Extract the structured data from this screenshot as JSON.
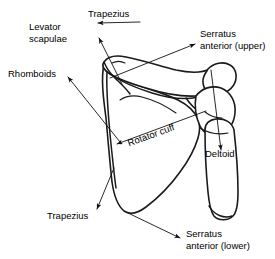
{
  "figure": {
    "view": "posterior",
    "background_color": "#ffffff",
    "line_color": "#1a1a1a"
  },
  "labels": {
    "trapezius_upper": "Trapezius",
    "levator_scapulae": "Levator\nscapulae",
    "levator_scapulae_line1": "Levator",
    "levator_scapulae_line2": "scapulae",
    "serratus_anterior_upper_line1": "Serratus",
    "serratus_anterior_upper_line2": "anterior (upper)",
    "rhomboids": "Rhomboids",
    "rotator_cuff": "Rotator cuff",
    "deltoid": "Deltoid",
    "trapezius_lower": "Trapezius",
    "serratus_anterior_lower_line1": "Serratus",
    "serratus_anterior_lower_line2": "anterior (lower)"
  },
  "annotations": [
    {
      "name": "trapezius-upper",
      "text": "Trapezius",
      "arrow_from": [
        140,
        22
      ],
      "arrow_to": [
        96,
        22
      ]
    },
    {
      "name": "levator-scapulae",
      "text": "Levator scapulae",
      "arrow_from": [
        120,
        82
      ],
      "arrow_to": [
        98,
        37
      ]
    },
    {
      "name": "serratus-anterior-upper",
      "text": "Serratus anterior (upper)",
      "arrow_from": [
        112,
        76
      ],
      "arrow_to": [
        196,
        44
      ]
    },
    {
      "name": "rhomboids",
      "text": "Rhomboids",
      "arrow_from": [
        118,
        140
      ],
      "arrow_to": [
        66,
        76
      ]
    },
    {
      "name": "rotator-cuff",
      "text": "Rotator cuff",
      "arrow_from": [
        206,
        111
      ],
      "arrow_to": [
        115,
        145
      ]
    },
    {
      "name": "deltoid",
      "text": "Deltoid",
      "arrow_from": [
        212,
        70
      ],
      "arrow_to": [
        222,
        152
      ]
    },
    {
      "name": "trapezius-lower",
      "text": "Trapezius",
      "arrow_from": [
        113,
        168
      ],
      "arrow_to": [
        96,
        210
      ]
    },
    {
      "name": "serratus-anterior-lower",
      "text": "Serratus anterior (lower)",
      "arrow_from": [
        128,
        213
      ],
      "arrow_to": [
        182,
        239
      ]
    }
  ]
}
